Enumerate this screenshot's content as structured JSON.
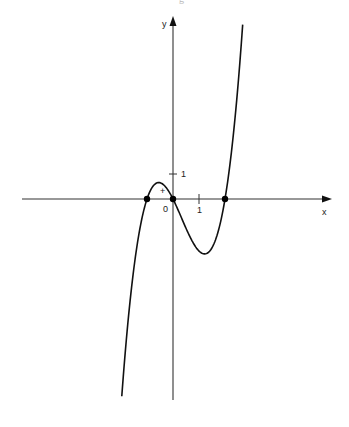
{
  "chart_data": {
    "type": "line",
    "title": "",
    "xlabel": "x",
    "ylabel": "y",
    "function": "y = x^3 - x^2 - 2x",
    "origin_label": "0",
    "x_tick_label": "1",
    "y_tick_label": "1",
    "region_annotation": "+",
    "roots": [
      -1,
      0,
      2
    ],
    "local_max": {
      "x": -0.55,
      "y": 0.63
    },
    "local_min": {
      "x": 1.22,
      "y": -2.11
    },
    "xlim": [
      -5.8,
      5.9
    ],
    "ylim": [
      -7.8,
      7.0
    ],
    "grid": false,
    "legend": null,
    "series": [
      {
        "name": "cubic",
        "x": [
          -1.97,
          -1.8,
          -1.6,
          -1.4,
          -1.2,
          -1.0,
          -0.8,
          -0.6,
          -0.4,
          -0.2,
          0,
          0.2,
          0.4,
          0.6,
          0.8,
          1.0,
          1.2,
          1.4,
          1.6,
          1.8,
          2.0,
          2.2,
          2.4,
          2.6,
          2.68
        ],
        "values": [
          -7.58,
          -5.83,
          -3.97,
          -2.5,
          -1.39,
          0.0,
          0.35,
          0.62,
          0.58,
          0.35,
          0.0,
          -0.43,
          -0.9,
          -1.34,
          -1.73,
          -2.0,
          -2.11,
          -2.02,
          -1.66,
          -1.01,
          0.0,
          1.41,
          3.26,
          5.58,
          6.67
        ]
      }
    ],
    "marked_points": [
      [
        -1,
        0
      ],
      [
        0,
        0
      ],
      [
        2,
        0
      ]
    ]
  },
  "page": {
    "top_fragment": "g"
  }
}
